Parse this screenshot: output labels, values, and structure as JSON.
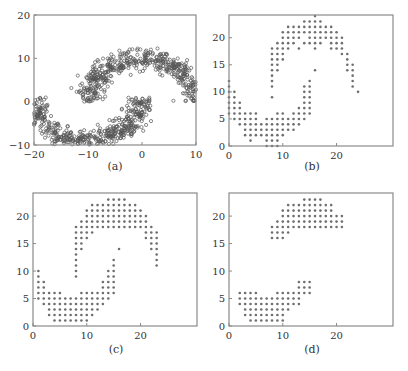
{
  "figure": {
    "captions": [
      "(a)",
      "(b)",
      "(c)",
      "(d)"
    ]
  },
  "style": {
    "axis_color": "#8a8a8a",
    "marker_color": "#6e6e6e",
    "marker_edge": "#555555",
    "text_color": "#333333"
  },
  "chart_data": [
    {
      "type": "scatter",
      "title": "",
      "caption": "(a)",
      "description": "Two interleaving half-moons (noisy continuous points)",
      "xlabel": "",
      "ylabel": "",
      "xlim": [
        -20,
        10
      ],
      "ylim": [
        -10,
        20
      ],
      "xticks": [
        -20,
        -10,
        0,
        10
      ],
      "yticks": [
        -10,
        0,
        10,
        20
      ],
      "grid": false,
      "series": [
        {
          "name": "upper moon",
          "center": [
            0,
            0
          ],
          "radius": 10,
          "angle_range_deg": [
            0,
            180
          ],
          "noise": 1.2,
          "n": 500
        },
        {
          "name": "lower moon",
          "center": [
            -10,
            1
          ],
          "radius": 10,
          "angle_range_deg": [
            180,
            360
          ],
          "noise": 1.2,
          "n": 500
        }
      ]
    },
    {
      "type": "scatter",
      "caption": "(b)",
      "description": "Quantized grid version of the two moons (integer lattice)",
      "xlim": [
        0,
        30.5
      ],
      "ylim": [
        0,
        24.2
      ],
      "xticks": [
        0,
        10,
        20
      ],
      "yticks": [
        0,
        5,
        10,
        15,
        20
      ],
      "grid": false,
      "rows": [
        {
          "y": 24,
          "x": [
            [
              16,
              16
            ]
          ]
        },
        {
          "y": 23,
          "x": [
            [
              14,
              17
            ]
          ]
        },
        {
          "y": 22,
          "x": [
            [
              11,
              19
            ]
          ]
        },
        {
          "y": 21,
          "x": [
            [
              10,
              20
            ]
          ]
        },
        {
          "y": 20,
          "x": [
            [
              10,
              13
            ],
            [
              15,
              21
            ]
          ]
        },
        {
          "y": 19,
          "x": [
            [
              9,
              12
            ],
            [
              14,
              17
            ],
            [
              19,
              21
            ]
          ]
        },
        {
          "y": 18,
          "x": [
            [
              8,
              11
            ],
            [
              13,
              13
            ],
            [
              16,
              16
            ],
            [
              19,
              21
            ]
          ]
        },
        {
          "y": 17,
          "x": [
            [
              8,
              10
            ],
            [
              21,
              22
            ]
          ]
        },
        {
          "y": 16,
          "x": [
            [
              8,
              10
            ],
            [
              22,
              22
            ]
          ]
        },
        {
          "y": 15,
          "x": [
            [
              8,
              9
            ],
            [
              22,
              23
            ]
          ]
        },
        {
          "y": 14,
          "x": [
            [
              8,
              9
            ],
            [
              16,
              16
            ],
            [
              22,
              23
            ]
          ]
        },
        {
          "y": 13,
          "x": [
            [
              8,
              8
            ],
            [
              23,
              23
            ]
          ]
        },
        {
          "y": 12,
          "x": [
            [
              0,
              0
            ],
            [
              8,
              8
            ],
            [
              15,
              15
            ],
            [
              23,
              23
            ]
          ]
        },
        {
          "y": 11,
          "x": [
            [
              0,
              0
            ],
            [
              8,
              8
            ],
            [
              14,
              15
            ],
            [
              23,
              23
            ]
          ]
        },
        {
          "y": 10,
          "x": [
            [
              0,
              1
            ],
            [
              14,
              15
            ],
            [
              24,
              24
            ]
          ]
        },
        {
          "y": 9,
          "x": [
            [
              0,
              1
            ],
            [
              8,
              8
            ],
            [
              14,
              15
            ]
          ]
        },
        {
          "y": 8,
          "x": [
            [
              0,
              2
            ],
            [
              14,
              15
            ]
          ]
        },
        {
          "y": 7,
          "x": [
            [
              0,
              2
            ],
            [
              13,
              15
            ]
          ]
        },
        {
          "y": 6,
          "x": [
            [
              0,
              5
            ],
            [
              9,
              10
            ],
            [
              12,
              15
            ]
          ]
        },
        {
          "y": 5,
          "x": [
            [
              1,
              5
            ],
            [
              7,
              14
            ]
          ]
        },
        {
          "y": 4,
          "x": [
            [
              2,
              13
            ]
          ]
        },
        {
          "y": 3,
          "x": [
            [
              3,
              12
            ]
          ]
        },
        {
          "y": 2,
          "x": [
            [
              3,
              10
            ]
          ]
        },
        {
          "y": 1,
          "x": [
            [
              4,
              4
            ],
            [
              7,
              9
            ]
          ]
        },
        {
          "y": 0,
          "x": [
            [
              7,
              9
            ]
          ]
        }
      ]
    },
    {
      "type": "scatter",
      "caption": "(c)",
      "description": "Grid two-moons after cleanup (isolated points removed)",
      "xlim": [
        0,
        30.5
      ],
      "ylim": [
        0,
        24.2
      ],
      "xticks": [
        0,
        10,
        20
      ],
      "yticks": [
        0,
        5,
        10,
        15,
        20
      ],
      "grid": false,
      "rows": [
        {
          "y": 23,
          "x": [
            [
              14,
              17
            ]
          ]
        },
        {
          "y": 22,
          "x": [
            [
              11,
              19
            ]
          ]
        },
        {
          "y": 21,
          "x": [
            [
              10,
              20
            ]
          ]
        },
        {
          "y": 20,
          "x": [
            [
              10,
              21
            ]
          ]
        },
        {
          "y": 19,
          "x": [
            [
              9,
              21
            ]
          ]
        },
        {
          "y": 18,
          "x": [
            [
              8,
              22
            ]
          ]
        },
        {
          "y": 17,
          "x": [
            [
              8,
              11
            ],
            [
              21,
              23
            ]
          ]
        },
        {
          "y": 16,
          "x": [
            [
              8,
              10
            ],
            [
              21,
              23
            ]
          ]
        },
        {
          "y": 15,
          "x": [
            [
              8,
              9
            ],
            [
              22,
              23
            ]
          ]
        },
        {
          "y": 14,
          "x": [
            [
              8,
              9
            ],
            [
              16,
              16
            ],
            [
              22,
              23
            ]
          ]
        },
        {
          "y": 13,
          "x": [
            [
              8,
              8
            ],
            [
              23,
              23
            ]
          ]
        },
        {
          "y": 12,
          "x": [
            [
              8,
              8
            ],
            [
              15,
              15
            ],
            [
              23,
              23
            ]
          ]
        },
        {
          "y": 11,
          "x": [
            [
              8,
              8
            ],
            [
              15,
              15
            ],
            [
              23,
              23
            ]
          ]
        },
        {
          "y": 10,
          "x": [
            [
              1,
              1
            ],
            [
              8,
              8
            ],
            [
              14,
              15
            ]
          ]
        },
        {
          "y": 9,
          "x": [
            [
              1,
              1
            ],
            [
              8,
              8
            ],
            [
              14,
              15
            ]
          ]
        },
        {
          "y": 8,
          "x": [
            [
              1,
              2
            ],
            [
              13,
              15
            ]
          ]
        },
        {
          "y": 7,
          "x": [
            [
              1,
              2
            ],
            [
              13,
              15
            ]
          ]
        },
        {
          "y": 6,
          "x": [
            [
              1,
              5
            ],
            [
              9,
              15
            ]
          ]
        },
        {
          "y": 5,
          "x": [
            [
              1,
              14
            ]
          ]
        },
        {
          "y": 4,
          "x": [
            [
              2,
              13
            ]
          ]
        },
        {
          "y": 3,
          "x": [
            [
              3,
              12
            ]
          ]
        },
        {
          "y": 2,
          "x": [
            [
              3,
              11
            ]
          ]
        },
        {
          "y": 1,
          "x": [
            [
              4,
              10
            ]
          ]
        }
      ]
    },
    {
      "type": "scatter",
      "caption": "(d)",
      "description": "Two separated clusters after further processing",
      "xlim": [
        0,
        30.5
      ],
      "ylim": [
        0,
        24.2
      ],
      "xticks": [
        0,
        10,
        20
      ],
      "yticks": [
        0,
        5,
        10,
        15,
        20
      ],
      "grid": false,
      "rows": [
        {
          "y": 23,
          "x": [
            [
              14,
              17
            ]
          ]
        },
        {
          "y": 22,
          "x": [
            [
              11,
              19
            ]
          ]
        },
        {
          "y": 21,
          "x": [
            [
              10,
              19
            ]
          ]
        },
        {
          "y": 20,
          "x": [
            [
              10,
              21
            ]
          ]
        },
        {
          "y": 19,
          "x": [
            [
              9,
              21
            ]
          ]
        },
        {
          "y": 18,
          "x": [
            [
              8,
              21
            ]
          ]
        },
        {
          "y": 17,
          "x": [
            [
              8,
              11
            ]
          ]
        },
        {
          "y": 16,
          "x": [
            [
              8,
              10
            ]
          ]
        },
        {
          "y": 8,
          "x": [
            [
              13,
              15
            ]
          ]
        },
        {
          "y": 7,
          "x": [
            [
              13,
              15
            ]
          ]
        },
        {
          "y": 6,
          "x": [
            [
              2,
              5
            ],
            [
              9,
              15
            ]
          ]
        },
        {
          "y": 5,
          "x": [
            [
              2,
              13
            ]
          ]
        },
        {
          "y": 4,
          "x": [
            [
              2,
              13
            ]
          ]
        },
        {
          "y": 3,
          "x": [
            [
              3,
              11
            ]
          ]
        },
        {
          "y": 2,
          "x": [
            [
              3,
              10
            ]
          ]
        },
        {
          "y": 1,
          "x": [
            [
              4,
              10
            ]
          ]
        }
      ]
    }
  ]
}
